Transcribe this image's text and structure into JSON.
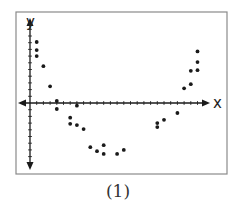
{
  "caption": "(1)",
  "chart_data": {
    "type": "scatter",
    "title": "",
    "xlabel": "x",
    "ylabel": "y",
    "grid": false,
    "legend": null,
    "axes_style": "arrow axes through origin with unlabeled tick marks",
    "tick_spacing_units": 1,
    "xlim": [
      -3.5,
      29
    ],
    "ylim": [
      -10.5,
      12
    ],
    "points": [
      {
        "x": 1,
        "y": 9.1
      },
      {
        "x": 1,
        "y": 7.9
      },
      {
        "x": 1,
        "y": 7.0
      },
      {
        "x": 2,
        "y": 5.5
      },
      {
        "x": 3,
        "y": 2.5
      },
      {
        "x": 4,
        "y": 0.3
      },
      {
        "x": 4,
        "y": -0.9
      },
      {
        "x": 7,
        "y": -0.4
      },
      {
        "x": 6,
        "y": -2.2
      },
      {
        "x": 6,
        "y": -3.1
      },
      {
        "x": 7,
        "y": -3.3
      },
      {
        "x": 8,
        "y": -3.9
      },
      {
        "x": 9,
        "y": -6.6
      },
      {
        "x": 10,
        "y": -7.2
      },
      {
        "x": 11,
        "y": -6.3
      },
      {
        "x": 11,
        "y": -7.6
      },
      {
        "x": 13,
        "y": -7.6
      },
      {
        "x": 14,
        "y": -7.0
      },
      {
        "x": 19,
        "y": -3.0
      },
      {
        "x": 19,
        "y": -3.6
      },
      {
        "x": 20,
        "y": -2.5
      },
      {
        "x": 22,
        "y": -1.5
      },
      {
        "x": 23,
        "y": 2.2
      },
      {
        "x": 24,
        "y": 2.8
      },
      {
        "x": 24,
        "y": 4.8
      },
      {
        "x": 25,
        "y": 4.9
      },
      {
        "x": 25,
        "y": 6.1
      },
      {
        "x": 25,
        "y": 7.7
      }
    ]
  },
  "colors": {
    "points": "#1a1a1a",
    "axes": "#1a1a1a",
    "frame": "#8a8a8a"
  }
}
